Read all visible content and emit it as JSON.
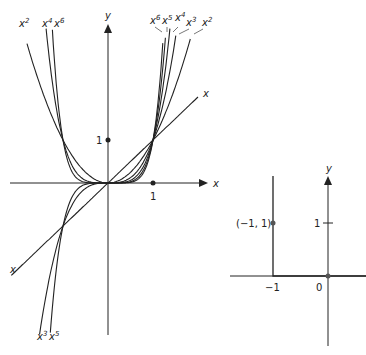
{
  "left_graph": {
    "origin_px": [
      108,
      183
    ],
    "scale_px": [
      45,
      43
    ],
    "x_axis_label": "x",
    "y_axis_label": "y",
    "tick_x_label": "1",
    "tick_y_label": "1",
    "curves": [
      {
        "name": "x",
        "exp": 1,
        "xmin": -2.15,
        "xmax": 2.0
      },
      {
        "name": "x^2",
        "exp": 2,
        "xmin": -1.8,
        "xmax": 1.83
      },
      {
        "name": "x^3",
        "exp": 3,
        "xmin": -1.6,
        "xmax": 1.56
      },
      {
        "name": "x^4",
        "exp": 4,
        "xmin": -1.4,
        "xmax": 1.4
      },
      {
        "name": "x^5",
        "exp": 5,
        "xmin": -1.35,
        "xmax": 1.32
      },
      {
        "name": "x^6",
        "exp": 6,
        "xmin": -1.3,
        "xmax": 1.26
      }
    ],
    "labels_top_left": [
      "x2",
      "x4",
      "x6"
    ],
    "labels_top_right": [
      "x6",
      "x5",
      "x4",
      "x3",
      "x2"
    ],
    "labels_bottom": [
      "x3",
      "x5"
    ],
    "line_label": "x"
  },
  "right_graph": {
    "y_axis_label": "y",
    "tick_y_label": "1",
    "tick_neg1_label": "−1",
    "origin_label": "0",
    "point_label": "(−1, 1)"
  }
}
